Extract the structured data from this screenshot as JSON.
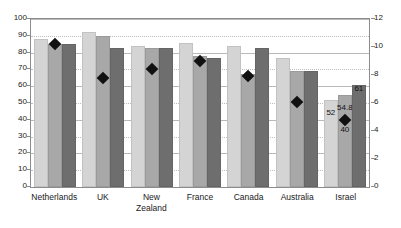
{
  "chart_data": {
    "type": "bar",
    "title": "",
    "subtitle": "",
    "xlabel": "",
    "ylabel": "",
    "categories": [
      "Netherlands",
      "UK",
      "New Zealand",
      "France",
      "Canada",
      "Australia",
      "Israel"
    ],
    "series": [
      {
        "name": "series-1",
        "axis": "left",
        "color": "#d4d4d4",
        "values": [
          88,
          92,
          84,
          86,
          84,
          77,
          52
        ]
      },
      {
        "name": "series-2",
        "axis": "left",
        "color": "#a8a8a8",
        "values": [
          85,
          90,
          83,
          78,
          67,
          69,
          54.8
        ]
      },
      {
        "name": "series-3",
        "axis": "left",
        "color": "#6e6e6e",
        "values": [
          85,
          83,
          83,
          77,
          83,
          69,
          61
        ]
      },
      {
        "name": "marker-series",
        "axis": "right",
        "type": "scatter",
        "color": "#111111",
        "values": [
          10.2,
          7.8,
          8.4,
          9.0,
          7.9,
          6.1,
          4.8
        ]
      }
    ],
    "marker_left_equivalents": [
      85,
      65,
      70,
      75,
      66,
      51,
      40
    ],
    "left_axis": {
      "min": 0,
      "max": 100,
      "step": 10,
      "ticks": [
        0,
        10,
        20,
        30,
        40,
        50,
        60,
        70,
        80,
        90,
        100
      ]
    },
    "right_axis": {
      "min": 0,
      "max": 12,
      "step": 2,
      "ticks": [
        0,
        2,
        4,
        6,
        8,
        10,
        12
      ]
    },
    "grid": true,
    "legend": "none",
    "data_labels": [
      {
        "text": "52",
        "category": "Israel",
        "series": "series-1",
        "value": 52
      },
      {
        "text": "54.8",
        "category": "Israel",
        "series": "series-2",
        "value": 54.8
      },
      {
        "text": "61",
        "category": "Israel",
        "series": "series-3",
        "value": 61
      },
      {
        "text": "40",
        "category": "Israel",
        "series": "marker-series",
        "value": 40
      }
    ]
  },
  "axis_labels": {
    "left": [
      "100",
      "90",
      "80",
      "70",
      "60",
      "50",
      "40",
      "30",
      "20",
      "10",
      "0"
    ],
    "right": [
      "12",
      "10",
      "8",
      "6",
      "4",
      "2",
      "0"
    ]
  },
  "category_labels": [
    {
      "line1": "Netherlands",
      "line2": ""
    },
    {
      "line1": "UK",
      "line2": ""
    },
    {
      "line1": "New",
      "line2": "Zealand"
    },
    {
      "line1": "France",
      "line2": ""
    },
    {
      "line1": "Canada",
      "line2": ""
    },
    {
      "line1": "Australia",
      "line2": ""
    },
    {
      "line1": "Israel",
      "line2": ""
    }
  ],
  "colors": {
    "series_1": "#d4d4d4",
    "series_2": "#a8a8a8",
    "series_3": "#6e6e6e",
    "marker": "#111111",
    "gridline": "#b9b9b9",
    "frame": "#8c8c8c"
  }
}
